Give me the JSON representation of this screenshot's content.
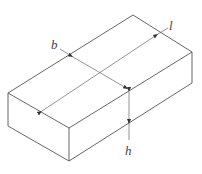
{
  "diagram": {
    "title": "",
    "type": "isometric rectangular block with dimensions",
    "labels": {
      "length": "l",
      "width": "b",
      "height": "h"
    },
    "colors": {
      "stroke": "#555555",
      "background": "#ffffff"
    }
  }
}
